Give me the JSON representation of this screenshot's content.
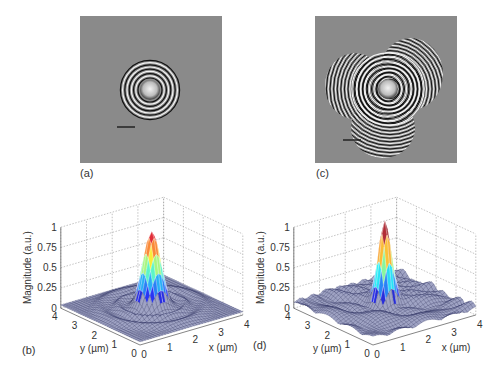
{
  "figure": {
    "panels": [
      {
        "id": "a",
        "label": "(a)",
        "type": "hologram-image",
        "description": "single object concentric rings",
        "scale_bar": true
      },
      {
        "id": "c",
        "label": "(c)",
        "type": "hologram-image",
        "description": "three overlapping fringe patterns",
        "scale_bar": true
      },
      {
        "id": "b",
        "label": "(b)",
        "type": "surface-3d"
      },
      {
        "id": "d",
        "label": "(d)",
        "type": "surface-3d"
      }
    ],
    "colors": {
      "image_bg": "#8a8a8a",
      "mesh": "#3b3f6e",
      "grid": "#9a9a9a"
    }
  },
  "chart_data": [
    {
      "type": "surface",
      "panel": "(b)",
      "zlabel": "Magnitude (a.u.)",
      "xlabel": "x (µm)",
      "ylabel": "y (µm)",
      "zticks": [
        "0",
        "0.25",
        "0.5",
        "0.75",
        "1"
      ],
      "xticks": [
        "0",
        "1",
        "2",
        "3",
        "4"
      ],
      "yticks": [
        "0",
        "1",
        "2",
        "3",
        "4"
      ],
      "zlim": [
        0,
        1
      ],
      "xlim": [
        0,
        4
      ],
      "ylim": [
        0,
        4
      ],
      "peak": {
        "x": 2,
        "y": 2,
        "z": 0.95
      },
      "grid": true,
      "notes": "Single central peak with circular ring ripple at ~0.1"
    },
    {
      "type": "surface",
      "panel": "(d)",
      "zlabel": "Magnitude (a.u.)",
      "xlabel": "x (µm)",
      "ylabel": "y (µm)",
      "zticks": [
        "0",
        "0.25",
        "0.5",
        "0.75",
        "1"
      ],
      "xticks": [
        "0",
        "1",
        "2",
        "3",
        "4"
      ],
      "yticks": [
        "0",
        "1",
        "2",
        "3",
        "4"
      ],
      "zlim": [
        0,
        1
      ],
      "xlim": [
        0,
        4
      ],
      "ylim": [
        0,
        4
      ],
      "peak": {
        "x": 2,
        "y": 2,
        "z": 0.95
      },
      "grid": true,
      "notes": "Narrower central peak with irregular background clutter ~0.1-0.15"
    }
  ],
  "labels": {
    "a": "(a)",
    "b": "(b)",
    "c": "(c)",
    "d": "(d)",
    "zlabel": "Magnitude (a.u.)",
    "xlabel": "x (µm)",
    "ylabel": "y (µm)"
  }
}
